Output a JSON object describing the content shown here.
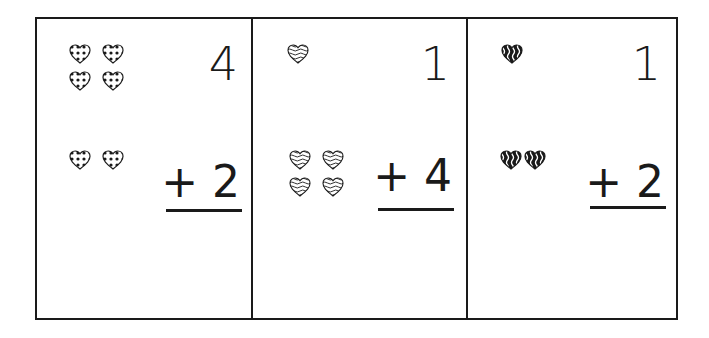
{
  "worksheet": {
    "problems": [
      {
        "top_number": "4",
        "operator": "+",
        "bottom_number": "2",
        "top_hearts": 4,
        "bottom_hearts": 2,
        "heart_pattern": "polka-dot"
      },
      {
        "top_number": "1",
        "operator": "+",
        "bottom_number": "4",
        "top_hearts": 1,
        "bottom_hearts": 4,
        "heart_pattern": "wavy-lines"
      },
      {
        "top_number": "1",
        "operator": "+",
        "bottom_number": "2",
        "top_hearts": 1,
        "bottom_hearts": 2,
        "heart_pattern": "black-wavy"
      }
    ]
  },
  "colors": {
    "ink": "#1a1a1a",
    "paper": "#ffffff"
  }
}
